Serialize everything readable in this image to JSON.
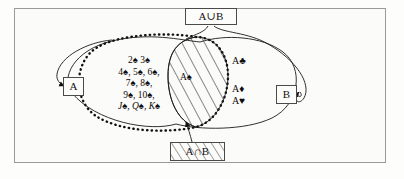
{
  "diagram": {
    "title_box_union": "A∪B",
    "title_box_intersection": "A∩B",
    "label_a": "A",
    "label_b": "B",
    "set_a_cards": [
      "2♠ 3♠",
      "4♠, 5♠, 6♠,",
      "7♠, 8♠,",
      "9♠, 10♠,",
      "J♠, Q♠, K♠"
    ],
    "intersection_element": "A♠",
    "set_b_only_elements": [
      "A♣",
      "A♦",
      "A♥"
    ],
    "colors": {
      "frame_border": "#9a9a9a",
      "page_background": "#fdfdfc",
      "ink": "#111111",
      "hatch": "#1a1a1a"
    }
  }
}
